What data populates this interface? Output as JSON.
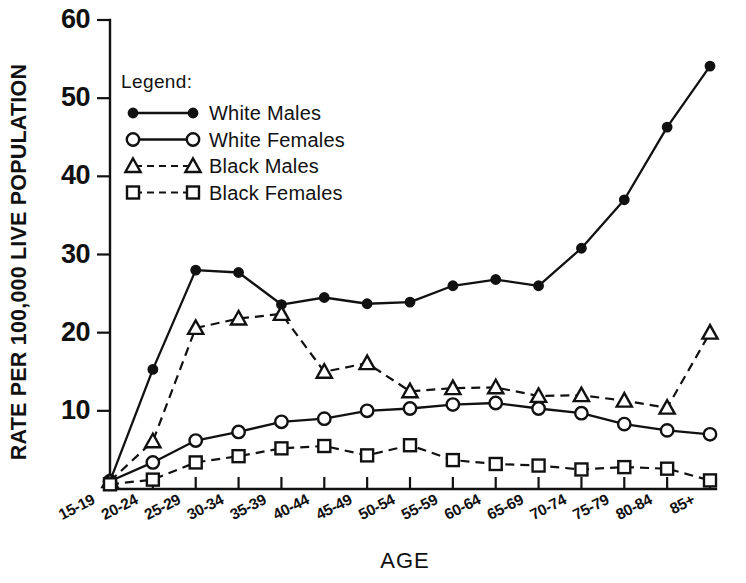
{
  "chart_data": {
    "type": "line",
    "title": "",
    "xlabel": "AGE",
    "ylabel": "RATE PER 100,000 LIVE POPULATION",
    "categories": [
      "15-19",
      "20-24",
      "25-29",
      "30-34",
      "35-39",
      "40-44",
      "45-49",
      "50-54",
      "55-59",
      "60-64",
      "65-69",
      "70-74",
      "75-79",
      "80-84",
      "85+"
    ],
    "ylim": [
      0,
      60
    ],
    "yticks": [
      0,
      10,
      20,
      30,
      40,
      50,
      60
    ],
    "ytick_labels": [
      "",
      "10",
      "20",
      "30",
      "40",
      "50",
      "60"
    ],
    "grid": false,
    "legend_position": "upper-left-inside",
    "legend_title": "Legend:",
    "series": [
      {
        "name": "White Males",
        "marker": "filled-circle",
        "linestyle": "solid",
        "values": [
          1.0,
          15.3,
          28.0,
          27.7,
          23.6,
          24.5,
          23.7,
          23.9,
          26.0,
          26.8,
          26.0,
          30.8,
          37.0,
          46.3,
          47.2
        ]
      },
      {
        "name": "White Females",
        "marker": "open-circle",
        "linestyle": "solid",
        "values": [
          1.0,
          3.4,
          6.2,
          7.3,
          8.6,
          9.0,
          10.0,
          10.3,
          10.8,
          11.0,
          10.3,
          9.7,
          8.3,
          7.5,
          7.3
        ]
      },
      {
        "name": "Black Males",
        "marker": "open-triangle",
        "linestyle": "dashed",
        "values": [
          1.0,
          6.1,
          20.6,
          21.8,
          22.4,
          15.0,
          16.1,
          12.5,
          12.9,
          13.0,
          11.9,
          12.0,
          11.3,
          10.4,
          14.2
        ]
      },
      {
        "name": "Black Females",
        "marker": "open-square",
        "linestyle": "dashed",
        "values": [
          0.6,
          1.2,
          3.4,
          4.2,
          5.2,
          5.5,
          4.3,
          5.6,
          3.7,
          3.2,
          3.0,
          2.5,
          2.8,
          2.6,
          1.9
        ]
      }
    ],
    "series_extra_points": {
      "White Males": {
        "85+": 54.1
      },
      "White Females": {
        "85+": 7.0
      },
      "Black Males": {
        "85+": 20.0
      },
      "Black Females": {
        "85+": 1.1
      }
    },
    "colors": {
      "ink": "#111111",
      "background": "#ffffff"
    }
  },
  "legend": {
    "title": "Legend:",
    "entries": [
      {
        "label": "White Males",
        "marker": "filled-circle",
        "linestyle": "solid"
      },
      {
        "label": "White Females",
        "marker": "open-circle",
        "linestyle": "solid"
      },
      {
        "label": "Black Males",
        "marker": "open-triangle",
        "linestyle": "dashed"
      },
      {
        "label": "Black Females",
        "marker": "open-square",
        "linestyle": "dashed"
      }
    ]
  }
}
